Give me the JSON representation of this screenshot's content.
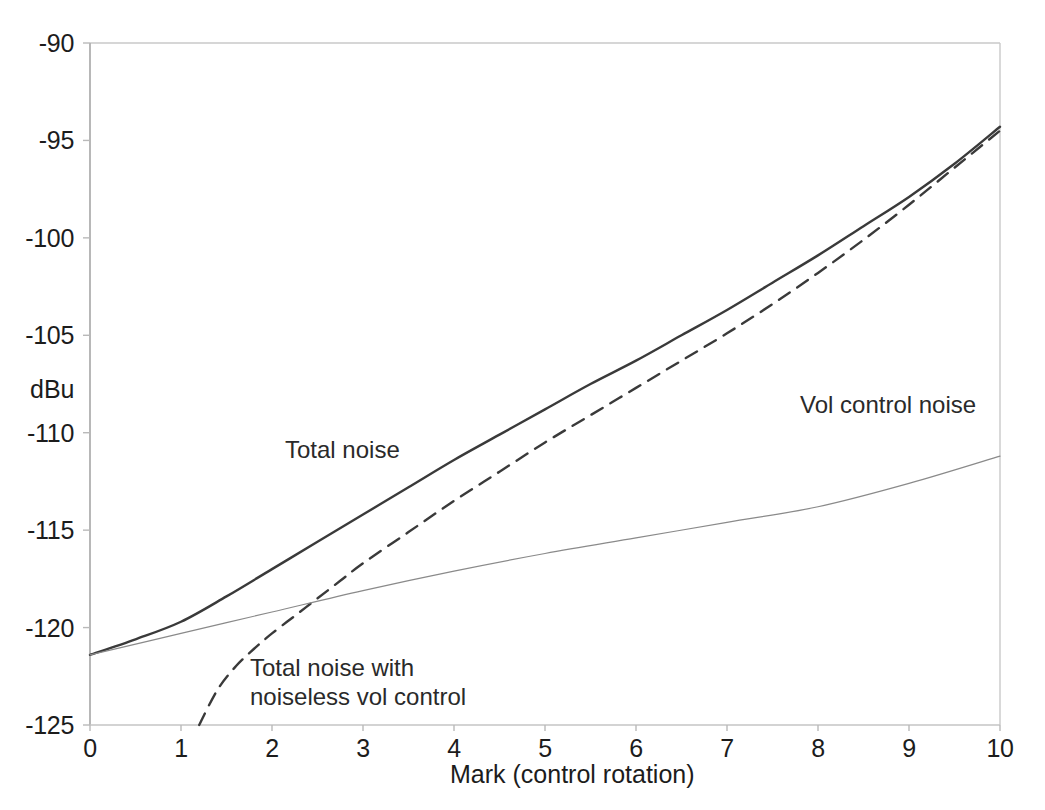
{
  "chart_data": {
    "type": "line",
    "title": "",
    "xlabel": "Mark  (control rotation)",
    "ylabel": "dBu",
    "xlim": [
      0,
      10
    ],
    "ylim": [
      -125,
      -90
    ],
    "grid": false,
    "legend_position": "inline-annotations",
    "xticks": [
      "0",
      "1",
      "2",
      "3",
      "4",
      "5",
      "6",
      "7",
      "8",
      "9",
      "10"
    ],
    "yticks": [
      "-90",
      "-95",
      "-100",
      "-105",
      "-110",
      "-115",
      "-120",
      "-125"
    ],
    "series": [
      {
        "name": "Total noise",
        "style": "solid",
        "color": "#3a3a3a",
        "width": 2.4,
        "x": [
          0,
          0.5,
          1,
          1.5,
          2,
          2.5,
          3,
          3.5,
          4,
          4.5,
          5,
          5.5,
          6,
          6.5,
          7,
          7.5,
          8,
          8.5,
          9,
          9.5,
          10
        ],
        "values": [
          -121.4,
          -120.6,
          -119.7,
          -118.4,
          -117.0,
          -115.6,
          -114.2,
          -112.8,
          -111.4,
          -110.1,
          -108.8,
          -107.5,
          -106.3,
          -105.0,
          -103.7,
          -102.3,
          -100.9,
          -99.4,
          -97.9,
          -96.2,
          -94.3
        ]
      },
      {
        "name": "Total noise with noiseless vol control",
        "style": "dashed",
        "color": "#3a3a3a",
        "width": 2.4,
        "x": [
          1.2,
          1.4,
          1.6,
          1.8,
          2,
          2.25,
          2.5,
          2.75,
          3,
          3.5,
          4,
          4.5,
          5,
          5.5,
          6,
          6.5,
          7,
          7.5,
          8,
          8.5,
          9,
          9.5,
          10
        ],
        "values": [
          -125.0,
          -123.2,
          -122.0,
          -121.1,
          -120.3,
          -119.4,
          -118.5,
          -117.6,
          -116.7,
          -115.1,
          -113.5,
          -112.0,
          -110.5,
          -109.1,
          -107.7,
          -106.3,
          -104.9,
          -103.4,
          -101.8,
          -100.1,
          -98.3,
          -96.4,
          -94.5
        ]
      },
      {
        "name": "Vol control noise",
        "style": "solid",
        "color": "#8a8a8a",
        "width": 1.2,
        "x": [
          0,
          1,
          2,
          3,
          4,
          5,
          6,
          7,
          8,
          9,
          10
        ],
        "values": [
          -121.4,
          -120.3,
          -119.2,
          -118.1,
          -117.1,
          -116.2,
          -115.4,
          -114.6,
          -113.8,
          -112.6,
          -111.2
        ]
      }
    ],
    "annotations": [
      {
        "text": "Total noise",
        "x": 2.45,
        "y": -111.8
      },
      {
        "text": "Vol control noise",
        "x": 7.95,
        "y": -108.5
      },
      {
        "text_line1": "Total noise with",
        "text_line2": "noiseless vol control",
        "x": 2.15,
        "y": -122.6
      }
    ]
  },
  "axes": {
    "y_label": "dBu",
    "x_label": "Mark  (control rotation)",
    "y_ticks": [
      "-90",
      "-95",
      "-100",
      "-105",
      "-110",
      "-115",
      "-120",
      "-125"
    ],
    "x_ticks": [
      "0",
      "1",
      "2",
      "3",
      "4",
      "5",
      "6",
      "7",
      "8",
      "9",
      "10"
    ]
  },
  "annotations": {
    "total_noise": "Total noise",
    "vol_control_noise": "Vol control noise",
    "noiseless_line1": "Total noise with",
    "noiseless_line2": "noiseless vol control"
  },
  "colors": {
    "axis": "#b9b9b9",
    "curve_dark": "#3a3a3a",
    "curve_light": "#8a8a8a",
    "text": "#1c1c1c",
    "background": "#ffffff"
  }
}
